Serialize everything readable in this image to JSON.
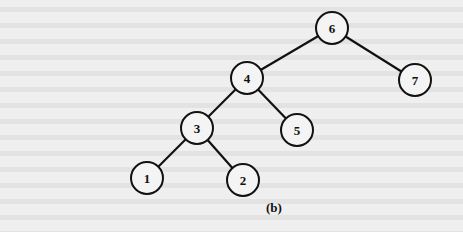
{
  "figure": {
    "caption": "(b)",
    "type": "binary-tree",
    "root": "6",
    "nodes": [
      {
        "id": "6",
        "label": "6",
        "x": 332,
        "y": 28
      },
      {
        "id": "4",
        "label": "4",
        "x": 247,
        "y": 78
      },
      {
        "id": "7",
        "label": "7",
        "x": 415,
        "y": 80
      },
      {
        "id": "3",
        "label": "3",
        "x": 197,
        "y": 128
      },
      {
        "id": "5",
        "label": "5",
        "x": 297,
        "y": 130
      },
      {
        "id": "1",
        "label": "1",
        "x": 147,
        "y": 178
      },
      {
        "id": "2",
        "label": "2",
        "x": 243,
        "y": 180
      }
    ],
    "edges": [
      {
        "from": "6",
        "to": "4"
      },
      {
        "from": "6",
        "to": "7"
      },
      {
        "from": "4",
        "to": "3"
      },
      {
        "from": "4",
        "to": "5"
      },
      {
        "from": "3",
        "to": "1"
      },
      {
        "from": "3",
        "to": "2"
      }
    ],
    "node_radius": 16,
    "colors": {
      "stroke": "#111111",
      "background": "#efefef"
    }
  }
}
